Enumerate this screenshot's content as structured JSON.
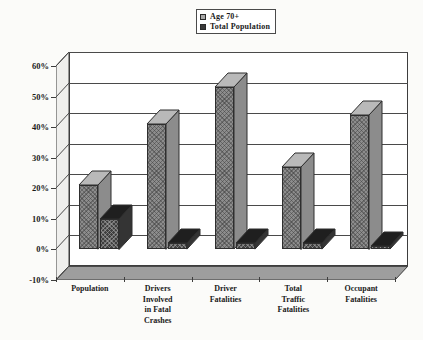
{
  "chart_data": {
    "type": "bar",
    "title": "",
    "subtitle": "",
    "xlabel": "",
    "ylabel": "",
    "grid": true,
    "legend_position": "top-center",
    "style": "3d-clustered-column",
    "ylim": [
      -10,
      60
    ],
    "ytick_labels": [
      "60%",
      "50%",
      "40%",
      "30%",
      "20%",
      "10%",
      "0%",
      "-10%"
    ],
    "ytick_values": [
      60,
      50,
      40,
      30,
      20,
      10,
      0,
      -10
    ],
    "categories": [
      "Population",
      "Drivers\nInvolved\nin Fatal\nCrashes",
      "Driver\nFatalities",
      "Total\nTraffic\nFatalities",
      "Occupant\nFatalities"
    ],
    "series": [
      {
        "name": "Age 70+",
        "color": "#9e9e9e",
        "values": [
          21,
          41,
          53,
          27,
          44
        ]
      },
      {
        "name": "Total Population",
        "color": "#3f3f3f",
        "values": [
          10,
          2,
          2,
          2,
          1
        ]
      }
    ]
  },
  "legend": {
    "items": [
      {
        "label": "Age 70+"
      },
      {
        "label": "Total Population"
      }
    ]
  },
  "colors": {
    "series_a": "#9e9e9e",
    "series_b": "#3f3f3f",
    "axis": "#3d3d3d",
    "plot_background": "#ffffff",
    "page_background": "#fbfbf9"
  }
}
